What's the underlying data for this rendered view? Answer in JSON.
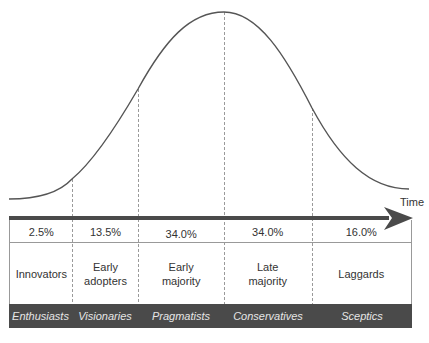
{
  "diagram": {
    "type": "bell-curve-adoption",
    "axis_label": "Time",
    "segments": [
      {
        "percent": "2.5%",
        "label_line1": "Innovators",
        "label_line2": "",
        "persona": "Enthusiasts"
      },
      {
        "percent": "13.5%",
        "label_line1": "Early",
        "label_line2": "adopters",
        "persona": "Visionaries"
      },
      {
        "percent": "34.0%",
        "label_line1": "Early",
        "label_line2": "majority",
        "persona": "Pragmatists"
      },
      {
        "percent": "34.0%",
        "label_line1": "Late",
        "label_line2": "majority",
        "persona": "Conservatives"
      },
      {
        "percent": "16.0%",
        "label_line1": "Laggards",
        "label_line2": "",
        "persona": "Sceptics"
      }
    ],
    "colors": {
      "curve": "#555555",
      "arrow": "#4a4a4a",
      "band": "#4a4a4a",
      "band_text": "#e6e6e6",
      "divider": "#999999"
    }
  }
}
